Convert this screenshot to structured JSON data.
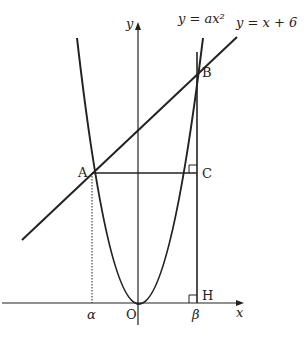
{
  "diagram": {
    "curve_label": "y = ax²",
    "line_label": "y = x + 6",
    "axis_x_label": "x",
    "axis_y_label": "y",
    "points": {
      "A": "A",
      "B": "B",
      "C": "C",
      "H": "H",
      "O": "O"
    },
    "alpha_label": "α",
    "beta_label": "β",
    "colors": {
      "stroke": "#222222",
      "background": "#ffffff"
    }
  }
}
